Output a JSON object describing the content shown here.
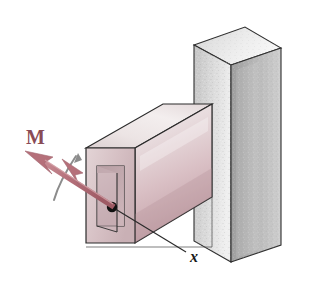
{
  "figure": {
    "type": "engineering-mechanics-diagram",
    "background_color": "#ffffff",
    "labels": {
      "moment": "M",
      "axis": "x"
    },
    "colors": {
      "moment_vector": "#b5707a",
      "moment_vector_dark": "#9d5c66",
      "moment_label": "#8a4b55",
      "rotation_arc": "#8c8c8c",
      "tube_top": "#e7dede",
      "tube_front_light": "#efe8e8",
      "tube_front_dark": "#c9a9af",
      "tube_end": "#d8c3c7",
      "tube_inner": "#c7aeb2",
      "wall_front": "#cfcfcf",
      "wall_side": "#a8a8a8",
      "wall_top": "#e6e6e6",
      "outline": "#2b2b2b",
      "leader_line": "#333333",
      "point_marker": "#111111"
    },
    "elements": [
      {
        "name": "wall",
        "label": "support wall"
      },
      {
        "name": "tube",
        "label": "hollow rectangular tube"
      },
      {
        "name": "moment-vector",
        "label": "M double-headed moment arrow"
      },
      {
        "name": "rotation-arc",
        "label": "curved rotation indicator"
      },
      {
        "name": "axis-point",
        "label": "x axis origin point"
      },
      {
        "name": "axis-leader",
        "label": "x axis leader line"
      }
    ]
  }
}
